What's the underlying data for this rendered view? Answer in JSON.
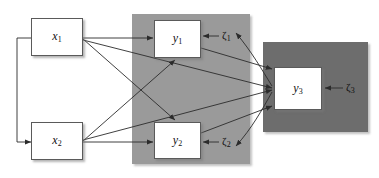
{
  "diagram": {
    "background_color": "#ffffff",
    "width": 379,
    "height": 178,
    "panels": [
      {
        "id": "panel-y-block",
        "name": "gray-panel-endogenous-y1-y2",
        "fill": "#9a9a9a",
        "x": 132,
        "y": 14,
        "width": 118,
        "height": 150
      },
      {
        "id": "panel-y3-block",
        "name": "dark-panel-endogenous-y3",
        "fill": "#6d6d6d",
        "x": 263,
        "y": 42,
        "width": 105,
        "height": 90
      }
    ],
    "nodes": [
      {
        "id": "x1",
        "name": "node-x1",
        "label": "x",
        "subscript": "1",
        "x": 31,
        "y": 18,
        "width": 52,
        "height": 38,
        "fill": "#ffffff"
      },
      {
        "id": "x2",
        "name": "node-x2",
        "label": "x",
        "subscript": "2",
        "x": 31,
        "y": 122,
        "width": 52,
        "height": 38,
        "fill": "#ffffff"
      },
      {
        "id": "y1",
        "name": "node-y1",
        "label": "y",
        "subscript": "1",
        "x": 154,
        "y": 20,
        "width": 47,
        "height": 38,
        "fill": "#ffffff"
      },
      {
        "id": "y2",
        "name": "node-y2",
        "label": "y",
        "subscript": "2",
        "x": 154,
        "y": 122,
        "width": 47,
        "height": 37,
        "fill": "#ffffff"
      },
      {
        "id": "y3",
        "name": "node-y3",
        "label": "y",
        "subscript": "3",
        "x": 274,
        "y": 67,
        "width": 48,
        "height": 43,
        "fill": "#ffffff"
      }
    ],
    "disturbances": [
      {
        "id": "zeta1",
        "name": "disturbance-zeta1",
        "label": "ζ",
        "subscript": "1",
        "x": 222,
        "y": 30,
        "target": "y1"
      },
      {
        "id": "zeta2",
        "name": "disturbance-zeta2",
        "label": "ζ",
        "subscript": "2",
        "x": 222,
        "y": 136,
        "target": "y2"
      },
      {
        "id": "zeta3",
        "name": "disturbance-zeta3",
        "label": "ζ",
        "subscript": "3",
        "x": 346,
        "y": 82,
        "target": "y3"
      }
    ],
    "edges": [
      {
        "name": "edge-x1-to-y1",
        "from": "x1",
        "to": "y1",
        "style": "straight"
      },
      {
        "name": "edge-x1-to-y2-top",
        "from": "x1",
        "to": "y2",
        "style": "straight"
      },
      {
        "name": "edge-x1-to-y3",
        "from": "x1",
        "to": "y3",
        "style": "straight"
      },
      {
        "name": "edge-x2-to-y2",
        "from": "x2",
        "to": "y2",
        "style": "straight"
      },
      {
        "name": "edge-x2-to-y1",
        "from": "x2",
        "to": "y1",
        "style": "straight"
      },
      {
        "name": "edge-x2-to-y3",
        "from": "x2",
        "to": "y3",
        "style": "straight"
      },
      {
        "name": "edge-y1-to-y3",
        "from": "y1",
        "to": "y3",
        "style": "straight"
      },
      {
        "name": "edge-y2-to-y3",
        "from": "y2",
        "to": "y3",
        "style": "straight"
      },
      {
        "name": "edge-zeta1-to-y1",
        "from": "zeta1",
        "to": "y1",
        "style": "straight"
      },
      {
        "name": "edge-zeta2-to-y2",
        "from": "zeta2",
        "to": "y2",
        "style": "straight"
      },
      {
        "name": "edge-zeta3-to-y3",
        "from": "zeta3",
        "to": "y3",
        "style": "straight"
      },
      {
        "name": "edge-y3-curve-to-zeta1",
        "from": "y3",
        "to": "zeta1",
        "style": "curved"
      },
      {
        "name": "edge-y3-curve-to-zeta2",
        "from": "y3",
        "to": "zeta2",
        "style": "curved"
      },
      {
        "name": "edge-covariance-x1-x2",
        "from": "x2",
        "to": "x1",
        "style": "double-headed-loop"
      }
    ],
    "line_color": "#2b2b2b",
    "box_border_color": "#5a5a5a"
  }
}
